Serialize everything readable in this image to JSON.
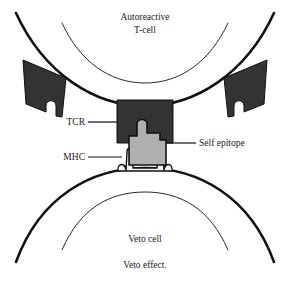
{
  "figure": {
    "caption": "Veto effect.",
    "background_color": "#ffffff",
    "outline_color": "#111111",
    "receptor_fill": "#333333",
    "epitope_fill": "#b0b0b0",
    "mhc_fill": "#f2f2f2",
    "text_color": "#1a1a1a"
  },
  "cells": {
    "top": {
      "name_line1": "Autoreactive",
      "name_line2": "T-cell"
    },
    "bottom": {
      "name": "Veto cell"
    }
  },
  "labels": {
    "tcr": "TCR",
    "mhc": "MHC",
    "epitope": "Self epitope"
  }
}
